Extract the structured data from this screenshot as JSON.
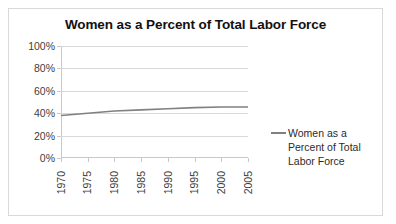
{
  "chart_data": {
    "type": "line",
    "title": "Women as a Percent of Total Labor Force",
    "xlabel": "",
    "ylabel": "",
    "x": [
      1970,
      1975,
      1980,
      1985,
      1990,
      1995,
      2000,
      2005
    ],
    "series": [
      {
        "name": "Women as a Percent of Total Labor Force",
        "values": [
          38,
          40,
          42,
          43,
          44,
          45,
          45.5,
          45.5
        ],
        "color": "#808080"
      }
    ],
    "xlim": [
      1970,
      2005
    ],
    "ylim": [
      0,
      100
    ],
    "ytick_labels": [
      "100%",
      "80%",
      "60%",
      "40%",
      "20%",
      "0%"
    ],
    "ytick_values": [
      100,
      80,
      60,
      40,
      20,
      0
    ],
    "xtick_labels": [
      "1970",
      "1975",
      "1980",
      "1985",
      "1990",
      "1995",
      "2000",
      "2005"
    ],
    "grid": true,
    "legend_position": "right",
    "legend_entries": [
      "Women as a Percent of Total Labor Force"
    ]
  },
  "legend": {
    "entry_label": "Women as a Percent of Total Labor Force"
  }
}
